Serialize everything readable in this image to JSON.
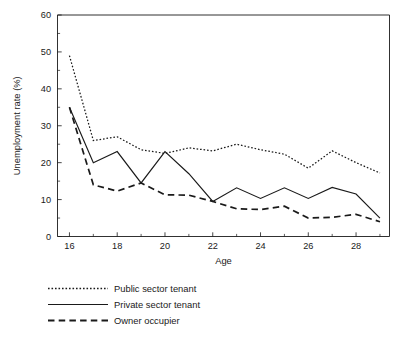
{
  "chart_data": {
    "type": "line",
    "title": "",
    "xlabel": "Age",
    "ylabel": "Unemployment rate (%)",
    "xlim": [
      15.5,
      29.4
    ],
    "ylim": [
      0,
      60
    ],
    "xticks": [
      16,
      18,
      20,
      22,
      24,
      26,
      28
    ],
    "xtick_labels": [
      "16",
      "18",
      "20",
      "22",
      "24",
      "26",
      "28"
    ],
    "xminor_ticks": [
      17,
      19,
      21,
      23,
      25,
      27,
      29
    ],
    "yticks": [
      0,
      10,
      20,
      30,
      40,
      50,
      60
    ],
    "ytick_labels": [
      "0",
      "10",
      "20",
      "30",
      "40",
      "50",
      "60"
    ],
    "yminor_ticks": [
      5,
      15,
      25,
      35,
      45,
      55
    ],
    "grid": false,
    "legend_position": "below-left",
    "x": [
      16,
      17,
      18,
      19,
      20,
      21,
      22,
      23,
      24,
      25,
      26,
      27,
      28,
      29
    ],
    "series": [
      {
        "name": "Public sector tenant",
        "style": "dotted",
        "values": [
          49,
          26,
          27,
          23.5,
          22.5,
          24,
          23.2,
          25,
          23.5,
          22.3,
          18.5,
          23.2,
          20,
          17.2
        ]
      },
      {
        "name": "Private sector tenant",
        "style": "solid",
        "values": [
          35,
          20,
          23,
          14.5,
          23,
          17,
          9.5,
          13.2,
          10.3,
          13.2,
          10.3,
          13.3,
          11.5,
          5
        ]
      },
      {
        "name": "Owner occupier",
        "style": "dashed",
        "values": [
          35,
          14,
          12.3,
          14.5,
          11.3,
          11.2,
          9.5,
          7.5,
          7.3,
          8.2,
          5,
          5.2,
          6,
          4
        ]
      }
    ],
    "colors": {
      "axis": "#1a1a1a",
      "series": "#1a1a1a",
      "background": "#ffffff"
    }
  },
  "legend": {
    "items": [
      {
        "label": "Public sector tenant"
      },
      {
        "label": "Private sector tenant"
      },
      {
        "label": "Owner occupier"
      }
    ]
  },
  "axes": {
    "x_title": "Age",
    "y_title": "Unemployment rate (%)"
  }
}
